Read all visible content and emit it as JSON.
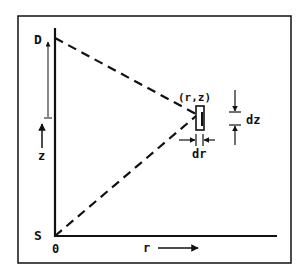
{
  "diagram": {
    "type": "geometry-schematic",
    "colors": {
      "ink": "#111111",
      "background": "#ffffff"
    },
    "points": {
      "detector": {
        "label": "D"
      },
      "source": {
        "label": "S"
      },
      "origin": {
        "label": "0"
      },
      "volume_element": {
        "label": "(r,z)"
      }
    },
    "axes": {
      "radial": {
        "label": "r"
      },
      "vertical": {
        "label": "z"
      }
    },
    "increments": {
      "dr": {
        "label": "dr"
      },
      "dz": {
        "label": "dz"
      }
    }
  }
}
